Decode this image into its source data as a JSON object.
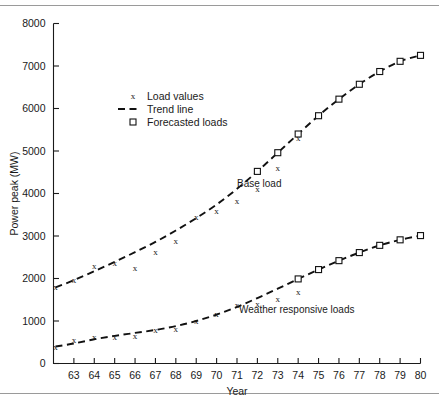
{
  "figure": {
    "has_top_rule": true,
    "has_bottom_rule": true,
    "background": "#ffffff",
    "ink": "#111111"
  },
  "chart_data": {
    "type": "line",
    "title": "",
    "xlabel": "Year",
    "ylabel": "Power peak (MW)",
    "xlim": [
      62,
      80
    ],
    "ylim": [
      0,
      8000
    ],
    "grid": false,
    "x_ticks": [
      63,
      64,
      65,
      66,
      67,
      68,
      69,
      70,
      71,
      72,
      73,
      74,
      75,
      76,
      77,
      78,
      79,
      80
    ],
    "x_tick_labels": [
      "63",
      "64",
      "65",
      "66",
      "67",
      "68",
      "69",
      "70",
      "71",
      "72",
      "73",
      "74",
      "75",
      "76",
      "77",
      "78",
      "79",
      "80"
    ],
    "y_ticks": [
      0,
      1000,
      2000,
      3000,
      4000,
      5000,
      6000,
      7000,
      8000
    ],
    "y_tick_labels": [
      "0",
      "1000",
      "2000",
      "3000",
      "4000",
      "5000",
      "6000",
      "7000",
      "8000"
    ],
    "legend": {
      "position": "upper-left-inset",
      "entries": [
        {
          "label": "Load values",
          "marker": "x"
        },
        {
          "label": "Trend line",
          "marker": "dashed-line"
        },
        {
          "label": "Forecasted loads",
          "marker": "square"
        }
      ]
    },
    "annotations": [
      {
        "text": "Base load",
        "x": 71.0,
        "y": 4150
      },
      {
        "text": "Weather responsive loads",
        "x": 71.1,
        "y": 1180
      }
    ],
    "series": [
      {
        "name": "Base load",
        "trend_line": {
          "x": [
            62.1,
            63,
            64,
            65,
            66,
            67,
            68,
            69,
            70,
            71,
            72,
            73,
            74,
            75,
            76,
            77,
            78,
            79,
            80
          ],
          "y": [
            1790,
            1960,
            2170,
            2390,
            2620,
            2860,
            3130,
            3420,
            3740,
            4110,
            4520,
            4960,
            5400,
            5830,
            6220,
            6570,
            6870,
            7110,
            7250
          ]
        },
        "load_values": {
          "x": [
            62.1,
            63,
            64,
            65,
            66,
            67,
            68,
            69,
            70,
            71,
            72,
            73,
            74,
            75
          ],
          "y": [
            1800,
            1960,
            2290,
            2360,
            2250,
            2620,
            2880,
            3450,
            3600,
            3820,
            4120,
            4600,
            5310,
            5840
          ]
        },
        "forecasted_loads": {
          "x": [
            72,
            73,
            74,
            75,
            76,
            77,
            78,
            79,
            80
          ],
          "y": [
            4520,
            4960,
            5400,
            5830,
            6220,
            6570,
            6870,
            7110,
            7250
          ]
        }
      },
      {
        "name": "Weather responsive loads",
        "trend_line": {
          "x": [
            62.1,
            63,
            64,
            65,
            66,
            67,
            68,
            69,
            70,
            71,
            72,
            73,
            74,
            75,
            76,
            77,
            78,
            79,
            80
          ],
          "y": [
            400,
            470,
            570,
            650,
            720,
            790,
            880,
            1000,
            1150,
            1330,
            1540,
            1760,
            1990,
            2210,
            2420,
            2610,
            2780,
            2910,
            3010
          ]
        },
        "load_values": {
          "x": [
            62.1,
            63,
            64,
            65,
            66,
            67,
            68,
            69,
            70,
            71,
            72,
            73,
            74
          ],
          "y": [
            400,
            560,
            620,
            640,
            660,
            800,
            820,
            1010,
            1180,
            1370,
            1400,
            1520,
            1680
          ]
        },
        "forecasted_loads": {
          "x": [
            74,
            75,
            76,
            77,
            78,
            79,
            80
          ],
          "y": [
            1990,
            2210,
            2420,
            2610,
            2780,
            2910,
            3010
          ]
        }
      }
    ]
  }
}
